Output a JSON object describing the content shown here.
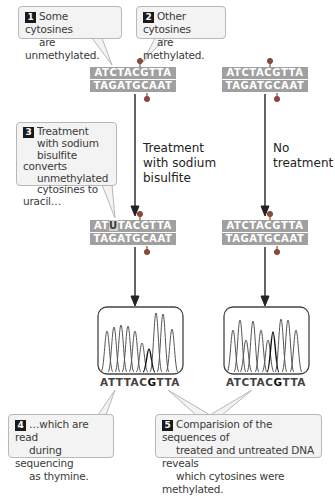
{
  "callouts": [
    {
      "number": "1",
      "line1": "Some cytosines",
      "line2": "are unmethylated."
    },
    {
      "number": "2",
      "line1": "Other cytosines",
      "line2": "are methylated."
    },
    {
      "number": "3",
      "lines": [
        "Treatment",
        "with sodium",
        "bisulfite converts",
        "unmethylated",
        "cytosines to uracil…"
      ]
    },
    {
      "number": "4",
      "lines": [
        "…which are read",
        "during sequencing",
        "as thymine."
      ]
    },
    {
      "number": "5",
      "lines": [
        "Comparision of the sequences of",
        "treated and untreated DNA reveals",
        "which cytosines were methylated."
      ]
    }
  ],
  "branches": {
    "treated": {
      "label_lines": [
        "Treatment",
        "with sodium",
        "bisulfite"
      ]
    },
    "untreated": {
      "label_lines": [
        "No",
        "treatment"
      ]
    }
  },
  "dna": {
    "original_left": {
      "top": "ATCTACGTTA",
      "bottom": "TAGATGCAAT"
    },
    "original_right": {
      "top": "ATCTACGTTA",
      "bottom": "TAGATGCAAT"
    },
    "treated": {
      "top_pre": "AT",
      "top_hl": "U",
      "top_post": "TACGTTA",
      "bottom": "TAGATGCAAT"
    },
    "untreated": {
      "top": "ATCTACGTTA",
      "bottom": "TAGATGCAAT"
    }
  },
  "sequencing": {
    "treated": {
      "pre": "ATTTAC",
      "bold": "G",
      "post": "TTA"
    },
    "untreated": {
      "pre": "ATCTAC",
      "bold": "G",
      "post": "TTA"
    }
  },
  "colors": {
    "strand_fill": "#a0a0a0",
    "callout_fill": "#f3f3f3",
    "callout_border": "#b8b8b8",
    "methyl_dot": "#8a4a3a",
    "arrow": "#222222"
  }
}
